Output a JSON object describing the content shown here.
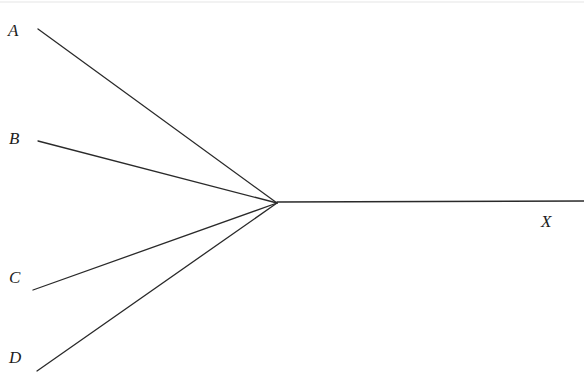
{
  "figure": {
    "kind": "line-diagram",
    "background_color": "#ffffff",
    "stroke_color": "#2a2a2a",
    "stroke_width": 1.3,
    "width": 584,
    "height": 372,
    "scan_artifact": {
      "present": true,
      "color": "#f2f2f2",
      "y": 2
    },
    "vertex": {
      "x": 277,
      "y": 203
    },
    "labels": [
      {
        "id": "A",
        "text": "A",
        "x": 8,
        "y": 22,
        "style": "italic-serif"
      },
      {
        "id": "B",
        "text": "B",
        "x": 9,
        "y": 130,
        "style": "italic-serif"
      },
      {
        "id": "C",
        "text": "C",
        "x": 9,
        "y": 269,
        "style": "italic-serif"
      },
      {
        "id": "D",
        "text": "D",
        "x": 9,
        "y": 349,
        "style": "italic-serif"
      },
      {
        "id": "X",
        "text": "X",
        "x": 541,
        "y": 213,
        "style": "italic-serif"
      }
    ],
    "segments": [
      {
        "id": "A",
        "x1": 38,
        "y1": 29,
        "x2": 277,
        "y2": 203
      },
      {
        "id": "B",
        "x1": 38,
        "y1": 141,
        "x2": 277,
        "y2": 203
      },
      {
        "id": "C",
        "x1": 33,
        "y1": 290,
        "x2": 277,
        "y2": 203
      },
      {
        "id": "D",
        "x1": 37,
        "y1": 371,
        "x2": 277,
        "y2": 203
      },
      {
        "id": "X",
        "x1": 277,
        "y1": 202,
        "x2": 584,
        "y2": 201
      }
    ]
  }
}
